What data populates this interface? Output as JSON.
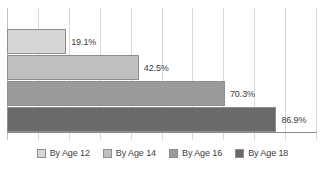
{
  "chart_data": {
    "type": "bar",
    "orientation": "horizontal",
    "title": "",
    "subtitle": "",
    "xlabel": "",
    "ylabel": "",
    "xlim": [
      0,
      100
    ],
    "xtick_labels": [],
    "grid": true,
    "gridline_count": 11,
    "legend_position": "bottom",
    "value_label_suffix": "%",
    "categories": [
      "By Age 12",
      "By Age 14",
      "By Age 16",
      "By Age 18"
    ],
    "values": [
      19.1,
      42.5,
      70.3,
      86.9
    ],
    "value_labels": [
      "19.1%",
      "42.5%",
      "70.3%",
      "86.9%"
    ],
    "colors": [
      "#d6d6d6",
      "#bfbfbf",
      "#9b9b9b",
      "#6a6a6a"
    ],
    "bar_border_color": "#8e8e8e",
    "series": [
      {
        "name": "By Age 12",
        "value": 19.1,
        "label": "19.1%",
        "color": "#d6d6d6"
      },
      {
        "name": "By Age 14",
        "value": 42.5,
        "label": "42.5%",
        "color": "#bfbfbf"
      },
      {
        "name": "By Age 16",
        "value": 70.3,
        "label": "70.3%",
        "color": "#9b9b9b"
      },
      {
        "name": "By Age 18",
        "value": 86.9,
        "label": "86.9%",
        "color": "#6a6a6a"
      }
    ]
  },
  "legend": {
    "items": [
      {
        "label": "By Age 12",
        "color": "#d6d6d6"
      },
      {
        "label": "By Age 14",
        "color": "#bfbfbf"
      },
      {
        "label": "By Age 16",
        "color": "#9b9b9b"
      },
      {
        "label": "By Age 18",
        "color": "#6a6a6a"
      }
    ]
  },
  "colors": {
    "gridline": "#d9d9d9",
    "axis": "#8a8a8a",
    "text": "#3d3d3d",
    "background": "#ffffff"
  }
}
